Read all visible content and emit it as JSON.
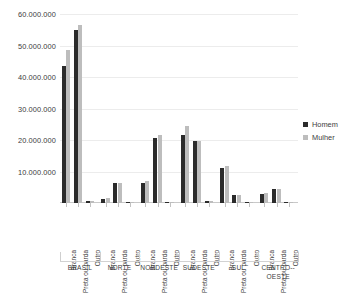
{
  "chart_data": {
    "type": "bar",
    "title": "",
    "xlabel": "",
    "ylabel": "",
    "ylim": [
      0,
      60000000
    ],
    "grid": true,
    "legend_position": "right",
    "y_ticks": [
      {
        "value": 60000000,
        "label": "60.000.000"
      },
      {
        "value": 50000000,
        "label": "50.000.000"
      },
      {
        "value": 40000000,
        "label": "40.000.000"
      },
      {
        "value": 30000000,
        "label": "30.000.000"
      },
      {
        "value": 20000000,
        "label": "20.000.000"
      },
      {
        "value": 10000000,
        "label": "10.000.000"
      }
    ],
    "categories": [
      "Branca",
      "Preta ou parda",
      "Outro"
    ],
    "legend": [
      {
        "name": "Homem",
        "color": "#2b2b2b"
      },
      {
        "name": "Mulher",
        "color": "#bdbdbd"
      }
    ],
    "groups": [
      {
        "region": "BRASIL",
        "bars": [
          {
            "category": "Branca",
            "Homem": 43500000,
            "Mulher": 48500000
          },
          {
            "category": "Preta ou parda",
            "Homem": 55000000,
            "Mulher": 56400000
          },
          {
            "category": "Outro",
            "Homem": 600000,
            "Mulher": 650000
          }
        ]
      },
      {
        "region": "NORTE",
        "bars": [
          {
            "category": "Branca",
            "Homem": 1400000,
            "Mulher": 1450000
          },
          {
            "category": "Preta ou parda",
            "Homem": 6400000,
            "Mulher": 6500000
          },
          {
            "category": "Outro",
            "Homem": 250000,
            "Mulher": 250000
          }
        ]
      },
      {
        "region": "NORDESTE",
        "bars": [
          {
            "category": "Branca",
            "Homem": 6200000,
            "Mulher": 7000000
          },
          {
            "category": "Preta ou parda",
            "Homem": 20700000,
            "Mulher": 21500000
          },
          {
            "category": "Outro",
            "Homem": 300000,
            "Mulher": 300000
          }
        ]
      },
      {
        "region": "SUDESTE",
        "bars": [
          {
            "category": "Branca",
            "Homem": 21700000,
            "Mulher": 24300000
          },
          {
            "category": "Preta ou parda",
            "Homem": 19700000,
            "Mulher": 19600000
          },
          {
            "category": "Outro",
            "Homem": 500000,
            "Mulher": 500000
          }
        ]
      },
      {
        "region": "SUL",
        "bars": [
          {
            "category": "Branca",
            "Homem": 11200000,
            "Mulher": 11700000
          },
          {
            "category": "Preta ou parda",
            "Homem": 2700000,
            "Mulher": 2700000
          },
          {
            "category": "Outro",
            "Homem": 150000,
            "Mulher": 150000
          }
        ]
      },
      {
        "region": "CENTRO--OESTE",
        "bars": [
          {
            "category": "Branca",
            "Homem": 2900000,
            "Mulher": 3100000
          },
          {
            "category": "Preta ou parda",
            "Homem": 4500000,
            "Mulher": 4600000
          },
          {
            "category": "Outro",
            "Homem": 200000,
            "Mulher": 200000
          }
        ]
      }
    ]
  }
}
